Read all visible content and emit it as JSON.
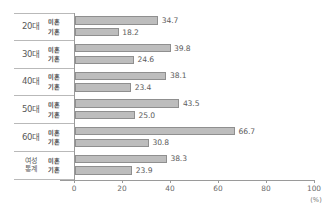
{
  "chart_data": {
    "type": "bar",
    "orientation": "horizontal",
    "title": "",
    "xlabel": "(%)",
    "ylabel": "",
    "xlim": [
      0,
      100
    ],
    "xticks": [
      "0",
      "20",
      "40",
      "60",
      "80",
      "100"
    ],
    "grid": false,
    "legend": "none",
    "unit": "(%)",
    "categories": [
      "20대",
      "30대",
      "40대",
      "50대",
      "60대",
      "여성 통계"
    ],
    "series": [
      {
        "name": "미혼",
        "values": [
          34.7,
          39.8,
          38.1,
          43.5,
          66.7,
          38.3
        ]
      },
      {
        "name": "기혼",
        "values": [
          18.2,
          24.6,
          23.4,
          25.0,
          30.8,
          23.9
        ]
      }
    ],
    "groups": [
      {
        "category": "20대",
        "category_lines": [
          "20대"
        ],
        "rows": [
          {
            "status": "미혼",
            "value": 34.7,
            "value_label": "34.7"
          },
          {
            "status": "기혼",
            "value": 18.2,
            "value_label": "18.2"
          }
        ]
      },
      {
        "category": "30대",
        "category_lines": [
          "30대"
        ],
        "rows": [
          {
            "status": "미혼",
            "value": 39.8,
            "value_label": "39.8"
          },
          {
            "status": "기혼",
            "value": 24.6,
            "value_label": "24.6"
          }
        ]
      },
      {
        "category": "40대",
        "category_lines": [
          "40대"
        ],
        "rows": [
          {
            "status": "미혼",
            "value": 38.1,
            "value_label": "38.1"
          },
          {
            "status": "기혼",
            "value": 23.4,
            "value_label": "23.4"
          }
        ]
      },
      {
        "category": "50대",
        "category_lines": [
          "50대"
        ],
        "rows": [
          {
            "status": "미혼",
            "value": 43.5,
            "value_label": "43.5"
          },
          {
            "status": "기혼",
            "value": 25.0,
            "value_label": "25.0"
          }
        ]
      },
      {
        "category": "60대",
        "category_lines": [
          "60대"
        ],
        "rows": [
          {
            "status": "미혼",
            "value": 66.7,
            "value_label": "66.7"
          },
          {
            "status": "기혼",
            "value": 30.8,
            "value_label": "30.8"
          }
        ]
      },
      {
        "category": "여성 통계",
        "category_lines": [
          "여성",
          "통계"
        ],
        "rows": [
          {
            "status": "미혼",
            "value": 38.3,
            "value_label": "38.3"
          },
          {
            "status": "기혼",
            "value": 23.9,
            "value_label": "23.9"
          }
        ]
      }
    ],
    "colors": {
      "bar_fill": "#bdbdbd",
      "bar_border": "#8f8f8f",
      "axis": "#9a9a9a",
      "text": "#5a5a5a",
      "table_border": "#b9b9b9"
    }
  }
}
